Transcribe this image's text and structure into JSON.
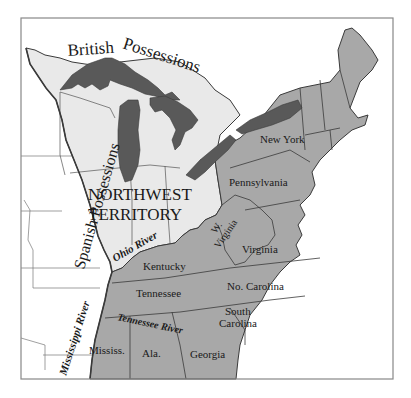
{
  "map": {
    "colors": {
      "states": "#a8a8a8",
      "northwest_territory": "#e9e9e9",
      "lakes": "#595959",
      "foreign": "#ffffff",
      "border": "#3a3a3a",
      "frame": "#888888"
    },
    "regions": {
      "british": "British Possessions",
      "british_1": "British",
      "british_2": "Possessions",
      "spanish": "Spanish Possessions",
      "nwt_line1": "NORTHWEST",
      "nwt_line2": "TERRITORY"
    },
    "rivers": {
      "ohio": "Ohio River",
      "mississippi": "Mississippi River",
      "tennessee": "Tennessee River"
    },
    "states": {
      "new_york": "New York",
      "pennsylvania": "Pennsylvania",
      "w_virginia_1": "W.",
      "w_virginia_2": "Virginia",
      "virginia": "Virginia",
      "kentucky": "Kentucky",
      "tennessee": "Tennessee",
      "no_carolina": "No. Carolina",
      "south_carolina_1": "South",
      "south_carolina_2": "Carolina",
      "mississ": "Mississ.",
      "ala": "Ala.",
      "georgia": "Georgia"
    }
  }
}
